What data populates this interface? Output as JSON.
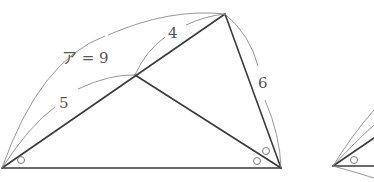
{
  "figure_1": {
    "vertices": {
      "A": [
        2,
        168
      ],
      "B": [
        281,
        168
      ],
      "C": [
        225,
        14
      ],
      "D": [
        135,
        75
      ]
    },
    "segments": [
      {
        "name": "AB",
        "from": "A",
        "to": "B"
      },
      {
        "name": "AC",
        "from": "A",
        "to": "C"
      },
      {
        "name": "BC",
        "from": "B",
        "to": "C"
      },
      {
        "name": "BD",
        "from": "B",
        "to": "D"
      }
    ],
    "labels": {
      "total_AC": "ア = 9",
      "DC": "4",
      "AD": "5",
      "BC": "6"
    },
    "angle_marks": [
      "○",
      "○",
      "○"
    ]
  },
  "figure_2_partial": {
    "vertex": [
      333,
      166
    ],
    "angle_mark": "○"
  },
  "colors": {
    "main_line": "#3a3a3a",
    "arc_line": "#8a8a8a",
    "label": "#555555",
    "background": "#ffffff"
  }
}
